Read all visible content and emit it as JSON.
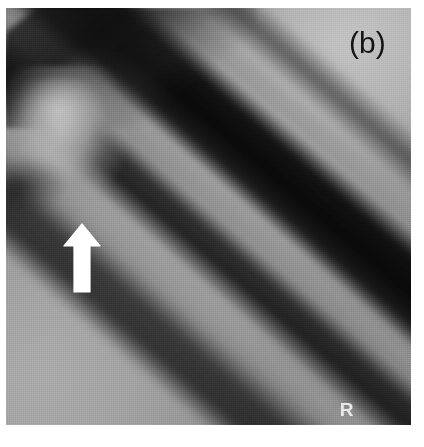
{
  "figure": {
    "kind": "radiograph",
    "panel_label": "(b)",
    "modality_note": "plain radiograph, grayscale",
    "background_color": "#ffffff"
  },
  "radiograph": {
    "description": "Diagonal long-bone shaft radiograph with proximal bone end at upper left",
    "plate_color": "#8d8d8d",
    "shaft_angle_deg": 40.5,
    "regions": [
      {
        "name": "soft-tissue-upper-right",
        "tone": "light-gray",
        "color": "#bcbcbc"
      },
      {
        "name": "soft-tissue-lower-left",
        "tone": "medium-gray",
        "color": "#a4a4a4"
      },
      {
        "name": "bone-end-proximal",
        "tone": "bright-gray",
        "color": "#c4c4c4"
      },
      {
        "name": "medullary-canal",
        "tone": "near-black",
        "color": "#060606"
      },
      {
        "name": "cortex-near",
        "tone": "gray",
        "color": "#969696"
      },
      {
        "name": "cortex-far",
        "tone": "gray",
        "color": "#929292"
      },
      {
        "name": "lucency-lower",
        "tone": "very-dark",
        "color": "#0f0f0f"
      },
      {
        "name": "periosteal-stripe",
        "tone": "gray",
        "color": "#989898"
      },
      {
        "name": "outer-dark-margin",
        "tone": "very-dark",
        "color": "#0c0c0c"
      },
      {
        "name": "corner-wedge-topleft",
        "tone": "dark",
        "color": "#1a1a1a"
      }
    ]
  },
  "annotations": {
    "arrow": {
      "icon": "arrow-up-icon",
      "color": "#ffffff",
      "direction": "up",
      "points_at": "cortical / periosteal abnormality along the bone shaft",
      "x": 56,
      "y": 214,
      "width": 40,
      "height": 72
    },
    "marker": {
      "text": "R",
      "color": "#f0f0f0",
      "legible": false,
      "note": "faint radiographic side marker, partly clipped at plate edge"
    },
    "panel_label": {
      "text": "(b)",
      "color": "#151515",
      "x": 349,
      "y": 26
    }
  }
}
